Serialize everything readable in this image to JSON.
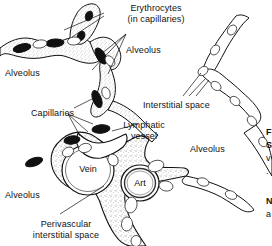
{
  "figure": {
    "kind": "anatomical-line-drawing",
    "background_color": "#ffffff",
    "ink_color": "#111111",
    "stipple_color": "#8d8d8d",
    "width": 272,
    "height": 246
  },
  "labels": {
    "erythrocytes": "Erythrocytes\n(in capillaries)",
    "alveolus_left": "Alveolus",
    "alveolus_top": "Alveolus",
    "alveolus_right": "Alveolus",
    "alveolus_bottom_left": "Alveolus",
    "interstitial_space": "Interstitial space",
    "capillaries": "Capillaries",
    "lymphatic_vessel": "Lymphatic\nvessel",
    "perivascular": "Perivascular\ninterstitial space",
    "vein": "Vein",
    "artery": "Art"
  },
  "edge_text": {
    "line1": "F",
    "line2": "S",
    "line3": "v",
    "line4": ".",
    "line5": "N",
    "line6": "a"
  },
  "icon_names": {
    "erythrocyte": "erythrocyte-icon",
    "endothelial_nucleus": "cell-nucleus-icon",
    "leader_line": "leader-line-icon"
  }
}
